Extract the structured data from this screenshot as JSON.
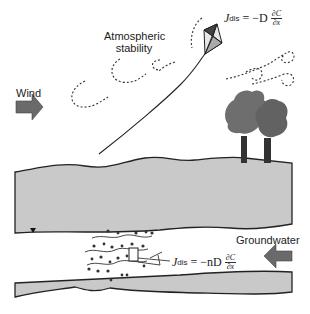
{
  "diagram": {
    "labels": {
      "wind": "Wind",
      "atmospheric_stability_line1": "Atmospheric",
      "atmospheric_stability_line2": "stability",
      "groundwater": "Groundwater"
    },
    "equations": {
      "air_flux": {
        "symbol": "J",
        "subscript": "dis",
        "rhs_prefix": "= −D",
        "numerator": "∂C",
        "denominator": "∂x"
      },
      "groundwater_flux": {
        "symbol": "J",
        "subscript": "dis",
        "rhs_prefix": "= −nD",
        "numerator": "∂C",
        "denominator": "∂x"
      }
    },
    "elements": [
      "wind-arrow",
      "kite",
      "kite-string",
      "turbulent-eddies",
      "trees",
      "unsaturated-soil-layer",
      "water-table-marker",
      "contaminant-plume",
      "control-volume",
      "groundwater-arrow",
      "aquitard-layer"
    ],
    "colors": {
      "soil_fill": "#c9c9c9",
      "outline": "#222222",
      "arrow_fill": "#6a6a6a",
      "tree_canopy": "#6e6e6e",
      "tree_trunk": "#333333"
    }
  }
}
